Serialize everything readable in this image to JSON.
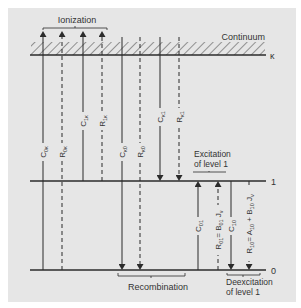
{
  "diagram": {
    "colors": {
      "panel": "#e6e6e6",
      "line": "#2b2b2b",
      "text": "#333333",
      "page": "#ffffff"
    },
    "levels": [
      {
        "id": "continuum",
        "label": "κ",
        "region_label": "Continuum",
        "y": 55
      },
      {
        "id": "level1",
        "label": "1",
        "y": 181
      },
      {
        "id": "level0",
        "label": "0",
        "y": 270
      }
    ],
    "groups": [
      {
        "id": "ionization",
        "label": "Ionization"
      },
      {
        "id": "recombination",
        "label": "Recombination"
      },
      {
        "id": "excitation",
        "label_line1": "Excitation",
        "label_line2": "of level 1"
      },
      {
        "id": "deexcitation",
        "label_line1": "Deexcitation",
        "label_line2": "of level 1"
      }
    ],
    "transitions": [
      {
        "id": "C0k",
        "base": "C",
        "sub": "0κ",
        "style": "solid",
        "direction": "up",
        "from": "0",
        "to": "κ",
        "x": 43
      },
      {
        "id": "R0k",
        "base": "R",
        "sub": "0κ",
        "style": "dashed",
        "direction": "up",
        "from": "0",
        "to": "κ",
        "x": 62
      },
      {
        "id": "C1k",
        "base": "C",
        "sub": "1κ",
        "style": "solid",
        "direction": "up",
        "from": "1",
        "to": "κ",
        "x": 83
      },
      {
        "id": "R1k",
        "base": "R",
        "sub": "1κ",
        "style": "dashed",
        "direction": "up",
        "from": "1",
        "to": "κ",
        "x": 102
      },
      {
        "id": "Ck0",
        "base": "C",
        "sub": "κ0",
        "style": "solid",
        "direction": "down",
        "from": "κ",
        "to": "0",
        "x": 122
      },
      {
        "id": "Rk0",
        "base": "R",
        "sub": "κ0",
        "style": "dashed",
        "direction": "down",
        "from": "κ",
        "to": "0",
        "x": 140
      },
      {
        "id": "Ck1",
        "base": "C",
        "sub": "κ1",
        "style": "solid",
        "direction": "down",
        "from": "κ",
        "to": "1",
        "x": 160
      },
      {
        "id": "Rk1",
        "base": "R",
        "sub": "κ1",
        "style": "dashed",
        "direction": "down",
        "from": "κ",
        "to": "1",
        "x": 179
      },
      {
        "id": "C01",
        "base": "C",
        "sub": "01",
        "style": "solid",
        "direction": "up",
        "from": "0",
        "to": "1",
        "x": 198
      },
      {
        "id": "R01",
        "base": "R",
        "sub": "01",
        "style": "dashed",
        "direction": "up",
        "from": "0",
        "to": "1",
        "x": 218,
        "equation": "= B",
        "eq_sub": "01",
        "eq_tail": " J",
        "eq_tail_sub": "ν"
      },
      {
        "id": "C10",
        "base": "C",
        "sub": "10",
        "style": "solid",
        "direction": "down",
        "from": "1",
        "to": "0",
        "x": 231
      },
      {
        "id": "R10",
        "base": "R",
        "sub": "10",
        "style": "dashed",
        "direction": "down",
        "from": "1",
        "to": "0",
        "x": 249,
        "equation": "= A",
        "eq_sub": "10",
        "eq_mid": " + B",
        "eq_mid_sub": "10",
        "eq_tail": " J",
        "eq_tail_sub": "ν"
      }
    ]
  }
}
